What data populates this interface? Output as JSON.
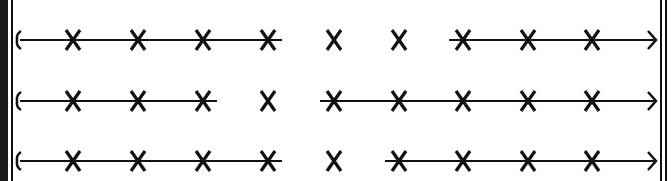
{
  "diagram": {
    "type": "timeline-rows",
    "ink_color": "#111111",
    "background_color": "#ffffff",
    "rows": [
      {
        "label": "row-1",
        "marks": [
          "X",
          "X",
          "X",
          "X",
          "X",
          "X",
          "X",
          "X",
          "X"
        ],
        "start_symbol": "{",
        "end_symbol": "arrow-right",
        "connected_segments": [
          [
            0,
            4
          ],
          [
            7,
            9
          ]
        ],
        "note": "line from left bracket through marks 1-5 (dashed after mark 5), marks 6-7 unconnected, line from mark 8 to arrow"
      },
      {
        "label": "row-2",
        "marks": [
          "X",
          "X",
          "X",
          "X",
          "X",
          "X",
          "X",
          "X",
          "X"
        ],
        "start_symbol": "{",
        "end_symbol": "arrow-right",
        "connected_segments": [
          [
            0,
            3
          ],
          [
            5,
            9
          ]
        ],
        "note": "line from left bracket through marks 1-4, marks 5-6 unconnected, line from mark 6 to arrow"
      },
      {
        "label": "row-3",
        "marks": [
          "X",
          "X",
          "X",
          "X",
          "X",
          "X",
          "X",
          "X",
          "X"
        ],
        "start_symbol": "{",
        "end_symbol": "arrow-right",
        "connected_segments": [
          [
            0,
            4
          ],
          [
            6,
            9
          ]
        ],
        "note": "line from left bracket through marks 1-5, marks 6-7 unconnected, line from mark 7 to arrow"
      }
    ]
  }
}
